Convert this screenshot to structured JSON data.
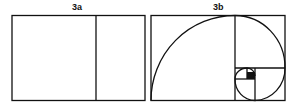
{
  "figures": [
    {
      "label": "3a",
      "description": "Golden rectangle divided into a square and a smaller rectangle"
    },
    {
      "label": "3b",
      "description": "Golden rectangle with successive square subdivisions and golden spiral"
    }
  ],
  "colors": {
    "line": "#111111",
    "background": "#ffffff"
  }
}
